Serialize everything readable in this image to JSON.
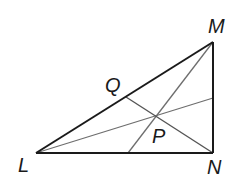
{
  "diagram": {
    "points": {
      "L": {
        "label": "L",
        "x": 36,
        "y": 153
      },
      "M": {
        "label": "M",
        "x": 213,
        "y": 42
      },
      "N": {
        "label": "N",
        "x": 213,
        "y": 153
      },
      "Q": {
        "label": "Q",
        "x": 126,
        "y": 97
      },
      "P": {
        "label": "P",
        "x": 157,
        "y": 116
      }
    },
    "triangle_sides": [
      "LM",
      "MN",
      "NL"
    ],
    "cevians": [
      {
        "from": "L",
        "to_point": [
          213,
          98
        ]
      },
      {
        "from": "M",
        "to_point": [
          128,
          153
        ]
      },
      {
        "from": "N",
        "to": "Q"
      }
    ],
    "colors": {
      "side": "#1a1a1a",
      "cevian": "#6e6e6e",
      "label": "#1a1a1a"
    }
  }
}
